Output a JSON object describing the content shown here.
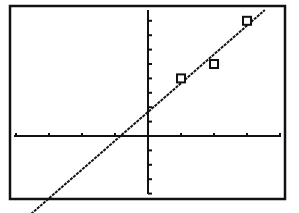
{
  "chart_data": {
    "type": "scatter",
    "title": "",
    "xlabel": "",
    "ylabel": "",
    "xlim": [
      -4,
      4
    ],
    "ylim": [
      -4,
      9
    ],
    "xscl": 1,
    "yscl": 1,
    "grid": false,
    "legend": null,
    "series": [
      {
        "name": "data points",
        "marker": "square",
        "x": [
          1,
          2,
          3
        ],
        "y": [
          4,
          5,
          8
        ]
      },
      {
        "name": "regression line",
        "type": "line",
        "style": "dotted",
        "slope": 2,
        "intercept": 1.67
      }
    ]
  },
  "colors": {
    "background": "#ffffff",
    "foreground": "#111111"
  }
}
